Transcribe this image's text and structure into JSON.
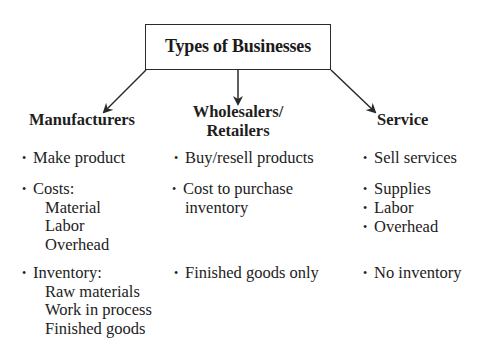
{
  "title": "Types of Businesses",
  "columns": [
    {
      "heading": [
        "Manufacturers"
      ],
      "items": [
        {
          "text": "Make product",
          "sub": []
        },
        {
          "text": "Costs:",
          "sub": [
            "Material",
            "Labor",
            "Overhead"
          ]
        },
        {
          "text": "Inventory:",
          "sub": [
            "Raw materials",
            "Work in process",
            "Finished goods"
          ]
        }
      ]
    },
    {
      "heading": [
        "Wholesalers/",
        "Retailers"
      ],
      "items": [
        {
          "text": "Buy/resell products",
          "sub": []
        },
        {
          "text": "Cost to purchase",
          "sub": [
            "inventory"
          ]
        },
        {
          "text": "Finished goods only",
          "sub": []
        }
      ]
    },
    {
      "heading": [
        "Service"
      ],
      "items": [
        {
          "text": "Sell services",
          "sub": []
        },
        {
          "text": "Supplies",
          "sub": []
        },
        {
          "text": "Labor",
          "sub": []
        },
        {
          "text": "Overhead",
          "sub": []
        },
        {
          "text": "No inventory",
          "sub": []
        }
      ]
    }
  ],
  "bullet_glyph": "•",
  "colors": {
    "line": "#2a2a2a",
    "text": "#1e1e1e"
  }
}
